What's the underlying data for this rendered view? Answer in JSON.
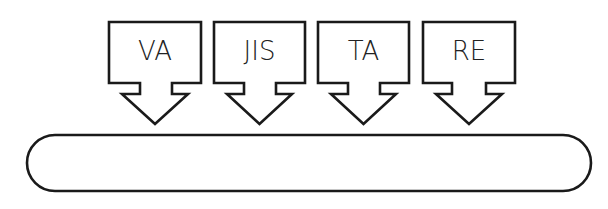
{
  "diagram": {
    "stroke_color": "#1a1a1a",
    "background": "#ffffff",
    "inputs": [
      {
        "label": "VA"
      },
      {
        "label": "JIS"
      },
      {
        "label": "TA"
      },
      {
        "label": "RE"
      }
    ],
    "target": {
      "shape": "rounded-pill",
      "label": ""
    }
  }
}
